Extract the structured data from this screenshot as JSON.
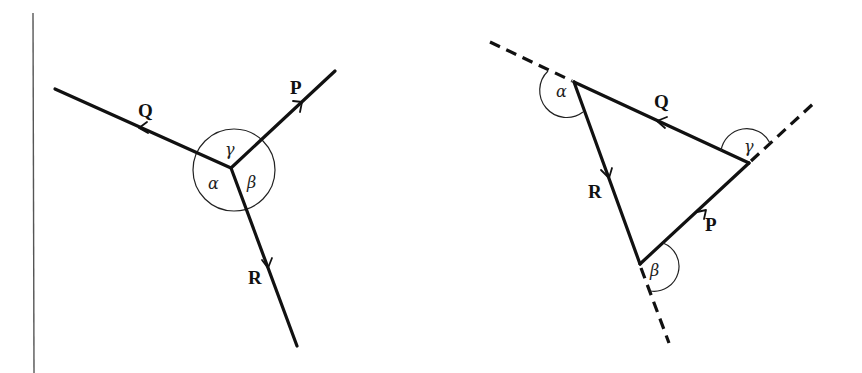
{
  "diagram": {
    "type": "force-triangle",
    "left_figure": {
      "description": "Three concurrent forces acting at a point",
      "vectors": [
        {
          "label": "Q",
          "direction": "upper-left"
        },
        {
          "label": "P",
          "direction": "upper-right"
        },
        {
          "label": "R",
          "direction": "down-right"
        }
      ],
      "angles": [
        {
          "label": "γ",
          "between": "Q and P"
        },
        {
          "label": "α",
          "between": "Q and R"
        },
        {
          "label": "β",
          "between": "P and R"
        }
      ]
    },
    "right_figure": {
      "description": "Triangle of forces with exterior angles",
      "vectors": [
        {
          "label": "Q",
          "side": "top"
        },
        {
          "label": "R",
          "side": "left"
        },
        {
          "label": "P",
          "side": "right"
        }
      ],
      "angles": [
        {
          "label": "α",
          "vertex": "top-left"
        },
        {
          "label": "γ",
          "vertex": "right"
        },
        {
          "label": "β",
          "vertex": "bottom"
        }
      ]
    }
  },
  "labels": {
    "left": {
      "Q": "Q",
      "P": "P",
      "R": "R",
      "alpha": "α",
      "beta": "β",
      "gamma": "γ"
    },
    "right": {
      "Q": "Q",
      "P": "P",
      "R": "R",
      "alpha": "α",
      "beta": "β",
      "gamma": "γ"
    }
  }
}
